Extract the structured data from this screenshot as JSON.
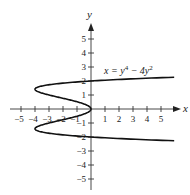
{
  "chart_data": {
    "type": "line",
    "title": "",
    "xlabel": "x",
    "ylabel": "y",
    "xlim": [
      -5.5,
      6
    ],
    "ylim": [
      -5.8,
      5.8
    ],
    "x_ticks": [
      "-5",
      "-4",
      "-3",
      "-2",
      "-1",
      "1",
      "2",
      "3",
      "4",
      "5"
    ],
    "y_ticks": [
      "5",
      "4",
      "3",
      "2",
      "1",
      "-1",
      "-2",
      "-3",
      "-4",
      "-5"
    ],
    "grid": false,
    "legend": [],
    "annotations": [
      "x = y⁴ − 4y²"
    ],
    "series": [
      {
        "name": "x = y^4 - 4y^2",
        "points": [
          {
            "y": -2.28,
            "x": 6.2
          },
          {
            "y": -2.0,
            "x": 0
          },
          {
            "y": -1.732,
            "x": -3
          },
          {
            "y": -1.414,
            "x": -4
          },
          {
            "y": -1.0,
            "x": -3
          },
          {
            "y": -0.5,
            "x": -0.9375
          },
          {
            "y": 0,
            "x": 0
          },
          {
            "y": 0.5,
            "x": -0.9375
          },
          {
            "y": 1.0,
            "x": -3
          },
          {
            "y": 1.414,
            "x": -4
          },
          {
            "y": 1.732,
            "x": -3
          },
          {
            "y": 2.0,
            "x": 0
          },
          {
            "y": 2.28,
            "x": 6.2
          }
        ]
      }
    ]
  },
  "labels": {
    "x_axis": "x",
    "y_axis": "y",
    "equation_prefix": "x = y",
    "equation_exp1": "4",
    "equation_mid": " − 4y",
    "equation_exp2": "2",
    "xt_m5": "−5",
    "xt_m4": "−4",
    "xt_m3": "−3",
    "xt_m2": "−2",
    "xt_m1": "−1",
    "xt_1": "1",
    "xt_2": "2",
    "xt_3": "3",
    "xt_4": "4",
    "xt_5": "5",
    "yt_5": "5",
    "yt_4": "4",
    "yt_3": "3",
    "yt_2": "2",
    "yt_1": "1",
    "yt_m1": "−1",
    "yt_m2": "−2",
    "yt_m3": "−3",
    "yt_m4": "−4",
    "yt_m5": "−5"
  }
}
